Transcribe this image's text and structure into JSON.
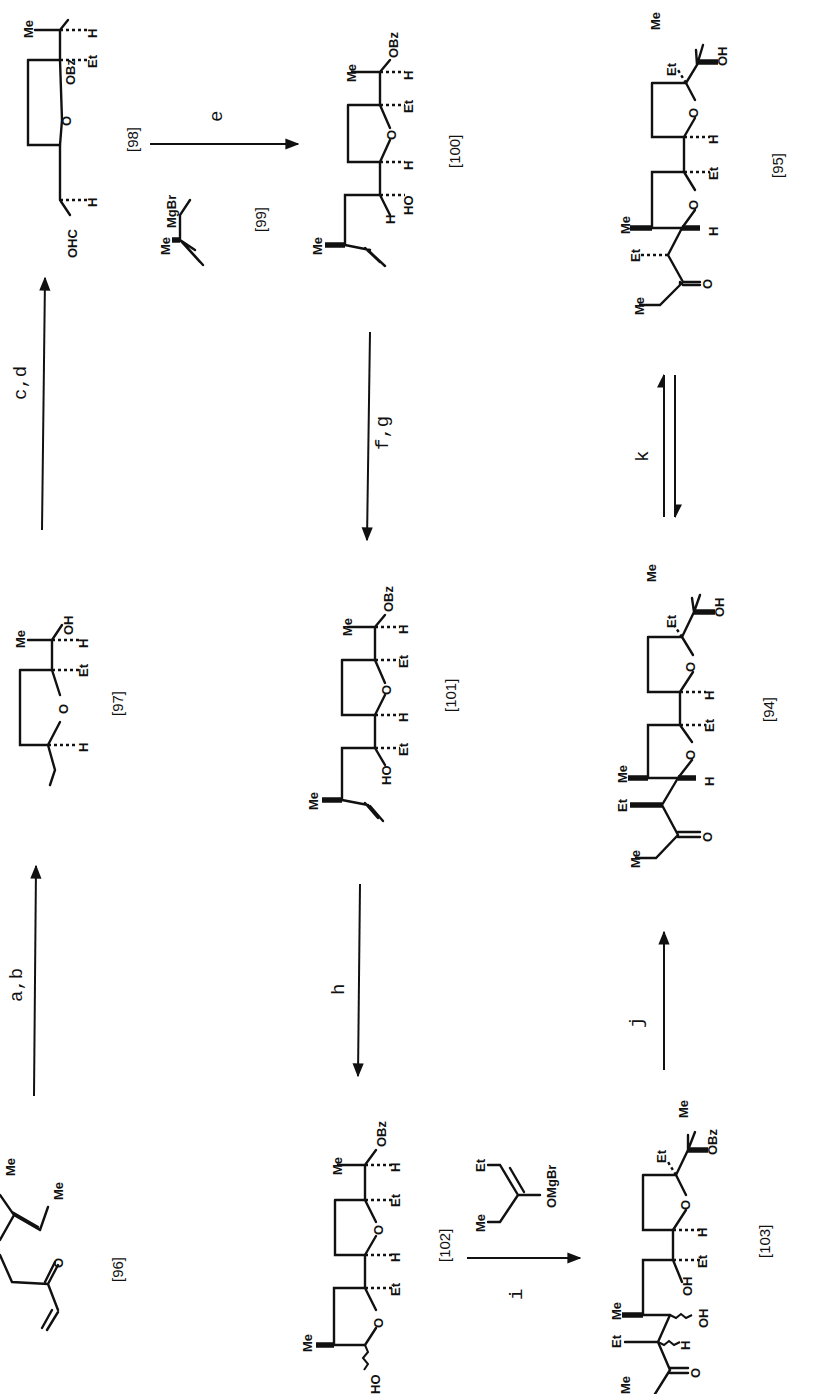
{
  "figure": {
    "type": "reaction-scheme",
    "orientation": "rotated-90-ccw",
    "compounds": [
      {
        "id": "96",
        "label": "[96]"
      },
      {
        "id": "97",
        "label": "[97]"
      },
      {
        "id": "98",
        "label": "[98]"
      },
      {
        "id": "99",
        "label": "[99]"
      },
      {
        "id": "100",
        "label": "[100]"
      },
      {
        "id": "101",
        "label": "[101]"
      },
      {
        "id": "102",
        "label": "[102]"
      },
      {
        "id": "103",
        "label": "[103]"
      },
      {
        "id": "94",
        "label": "[94]"
      },
      {
        "id": "95",
        "label": "[95]"
      }
    ],
    "steps": [
      {
        "from": "96",
        "to": "97",
        "reagents": "a,b"
      },
      {
        "from": "97",
        "to": "98",
        "reagents": "c,d"
      },
      {
        "from": "98",
        "to": "100",
        "reagents": "e",
        "reagent_compound": "99"
      },
      {
        "from": "100",
        "to": "101",
        "reagents": "f,g"
      },
      {
        "from": "101",
        "to": "102",
        "reagents": "h"
      },
      {
        "from": "102",
        "to": "103",
        "reagents": "i"
      },
      {
        "from": "103",
        "to": "94",
        "reagents": "j"
      },
      {
        "from": "94",
        "to": "95",
        "reagents": "k",
        "equilibrium": true
      }
    ],
    "atoms": {
      "me": "Me",
      "et": "Et",
      "h": "H",
      "o": "O",
      "oh": "OH",
      "ho": "HO",
      "obz": "OBz",
      "ohc": "OHC",
      "mgbr": "MgBr",
      "omgbr": "OMgBr"
    }
  }
}
